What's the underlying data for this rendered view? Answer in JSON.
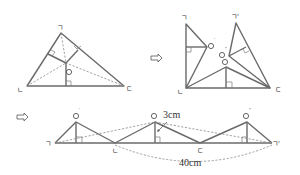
{
  "figure1": {
    "vertices": {
      "top": "ㄱ",
      "left": "ㄴ",
      "right": "ㄷ"
    },
    "incenter": "O"
  },
  "figure2": {
    "vertices": {
      "top_left": "ㄱ",
      "top_right": "ㄱ'",
      "left": "ㄴ",
      "right": "ㄷ"
    },
    "points": {
      "o_prime": "O'",
      "o_double_prime": "O''",
      "o": "O"
    }
  },
  "figure3": {
    "vertices": {
      "left": "ㄱ",
      "mid_left": "ㄴ",
      "mid_right": "ㄷ",
      "right": "ㄱ'"
    },
    "points": {
      "o_prime": "O'",
      "o": "O",
      "o_double_prime": "O''"
    },
    "height_label": "3cm",
    "length_label": "40cm"
  },
  "arrows": [
    "⇨",
    "⇨"
  ]
}
